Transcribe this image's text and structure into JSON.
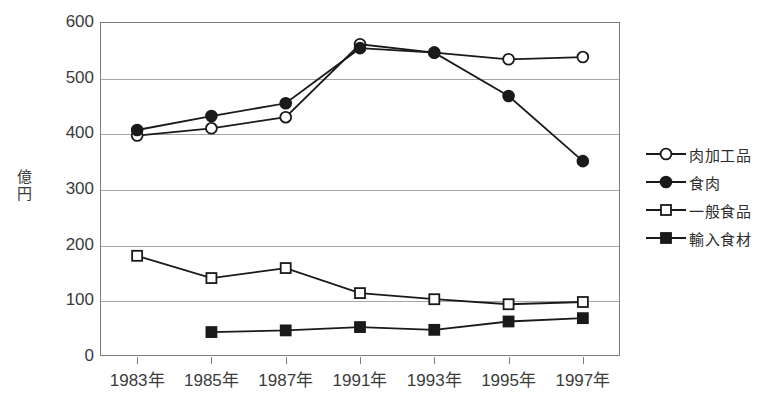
{
  "chart_data": {
    "type": "line",
    "title": "",
    "xlabel": "",
    "ylabel": "億円",
    "categories": [
      "1983年",
      "1985年",
      "1987年",
      "1991年",
      "1993年",
      "1995年",
      "1997年"
    ],
    "ylim": [
      0,
      600
    ],
    "yticks": [
      0,
      100,
      200,
      300,
      400,
      500,
      600
    ],
    "ytick_labels": [
      "0",
      "100",
      "200",
      "300",
      "400",
      "500",
      "600"
    ],
    "grid": true,
    "legend_position": "right",
    "series": [
      {
        "name": "肉加工品",
        "marker": "open-circle",
        "values": [
          396,
          409,
          429,
          560,
          545,
          533,
          537
        ]
      },
      {
        "name": "食肉",
        "marker": "filled-circle",
        "values": [
          406,
          431,
          454,
          553,
          545,
          467,
          350
        ]
      },
      {
        "name": "一般食品",
        "marker": "open-square",
        "values": [
          180,
          140,
          158,
          113,
          102,
          93,
          97
        ]
      },
      {
        "name": "輸入食材",
        "marker": "filled-square",
        "values": [
          null,
          43,
          46,
          52,
          47,
          62,
          68
        ]
      }
    ]
  },
  "axis": {
    "ylabel_chars": [
      "億",
      "円"
    ]
  },
  "legend": {
    "items": [
      {
        "label": "肉加工品",
        "marker": "open-circle"
      },
      {
        "label": "食肉",
        "marker": "filled-circle"
      },
      {
        "label": "一般食品",
        "marker": "open-square"
      },
      {
        "label": "輸入食材",
        "marker": "filled-square"
      }
    ]
  },
  "colors": {
    "line": "#1a1a1a",
    "grid": "#a6a6a6",
    "frame": "#7c7c7c",
    "text": "#3b3b3b",
    "marker_fill": "#ffffff"
  }
}
